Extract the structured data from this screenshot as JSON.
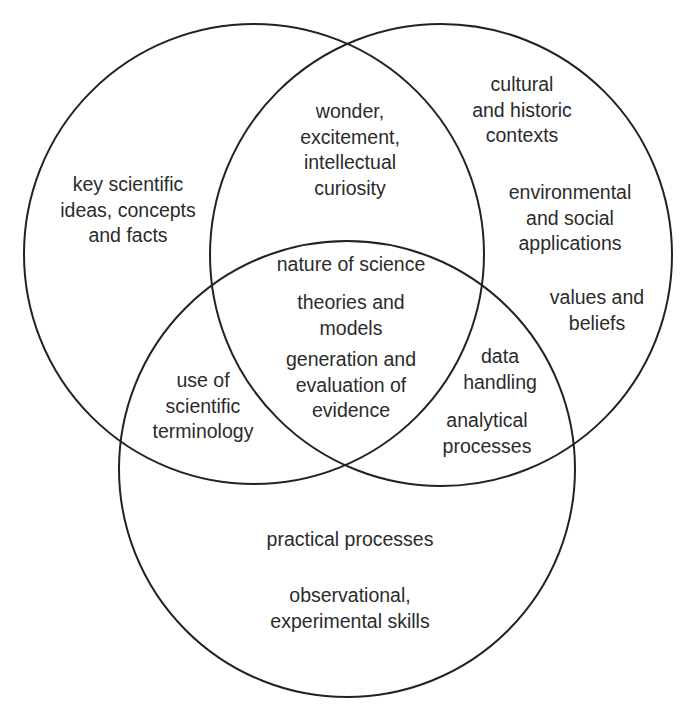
{
  "diagram": {
    "type": "venn",
    "circles": [
      {
        "id": "left",
        "cx": 254,
        "cy": 254,
        "r": 230
      },
      {
        "id": "right",
        "cx": 441,
        "cy": 255,
        "r": 231
      },
      {
        "id": "bottom",
        "cx": 347,
        "cy": 469,
        "r": 228
      }
    ],
    "stroke_color": "#222222",
    "text_color": "#2b2b2b",
    "regions": {
      "left_only": {
        "lines": [
          "key scientific",
          "ideas, concepts",
          "and facts"
        ]
      },
      "left_right": {
        "lines": [
          "wonder,",
          "excitement,",
          "intellectual",
          "curiosity"
        ]
      },
      "right_only_1": {
        "lines": [
          "cultural",
          "and historic",
          "contexts"
        ]
      },
      "right_only_2": {
        "lines": [
          "environmental",
          "and social",
          "applications"
        ]
      },
      "right_only_3": {
        "lines": [
          "values and",
          "beliefs"
        ]
      },
      "center_1": {
        "lines": [
          "nature of science"
        ]
      },
      "center_2": {
        "lines": [
          "theories and",
          "models"
        ]
      },
      "center_3": {
        "lines": [
          "generation and",
          "evaluation of",
          "evidence"
        ]
      },
      "left_bottom": {
        "lines": [
          "use of",
          "scientific",
          "terminology"
        ]
      },
      "right_bottom_1": {
        "lines": [
          "data",
          "handling"
        ]
      },
      "right_bottom_2": {
        "lines": [
          "analytical",
          "processes"
        ]
      },
      "bottom_only_1": {
        "lines": [
          "practical processes"
        ]
      },
      "bottom_only_2": {
        "lines": [
          "observational,",
          "experimental skills"
        ]
      }
    }
  }
}
